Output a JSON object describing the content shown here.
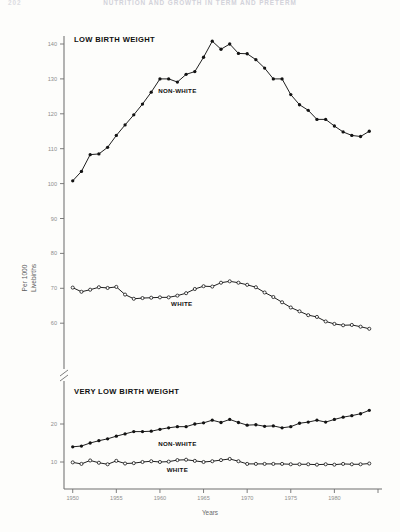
{
  "page": {
    "running_head": "NUTRITION AND GROWTH IN TERM AND PRETERM",
    "folio": "202"
  },
  "chart_data": {
    "type": "line",
    "title": "",
    "xlabel": "Years",
    "ylabel": "Per 1000\nLivebirths",
    "ylabel_line1": "Per 1000",
    "ylabel_line2": "Livebirths",
    "x_ticks": [
      1950,
      1955,
      1960,
      1965,
      1970,
      1975,
      1980
    ],
    "x_tick_labels": [
      "1950",
      "1955",
      "1960",
      "1965",
      "1970",
      "1975",
      "1980"
    ],
    "xlim": [
      1949,
      1985
    ],
    "grid": false,
    "legend_position": "inline-annotations",
    "axis_break": {
      "between": [
        60,
        20
      ],
      "symbol": "//"
    },
    "upper_panel": {
      "title": "LOW BIRTH WEIGHT",
      "y_ticks": [
        140,
        130,
        120,
        110,
        100,
        90,
        80,
        70,
        60
      ],
      "y_tick_labels": [
        "140",
        "130",
        "120",
        "110",
        "100",
        "90",
        "80",
        "70",
        "60"
      ],
      "ylim": [
        58,
        144
      ]
    },
    "lower_panel": {
      "title": "VERY LOW BIRTH WEIGHT",
      "y_ticks": [
        20,
        10
      ],
      "y_tick_labels": [
        "20",
        "10"
      ],
      "ylim": [
        5,
        27
      ]
    },
    "series": [
      {
        "name": "NON-WHITE",
        "panel": "upper",
        "marker": "filled",
        "label": "NON-WHITE",
        "label_x": 1962.0,
        "label_y": 126.0,
        "x": [
          1950,
          1951,
          1952,
          1953,
          1954,
          1955,
          1956,
          1957,
          1958,
          1959,
          1960,
          1961,
          1962,
          1963,
          1964,
          1965,
          1966,
          1967,
          1968,
          1969,
          1970,
          1971,
          1972,
          1973,
          1974,
          1975,
          1976,
          1977,
          1978,
          1979,
          1980,
          1981,
          1982,
          1983,
          1984
        ],
        "values": [
          100.8,
          103.5,
          108.3,
          108.5,
          110.4,
          113.8,
          116.8,
          119.7,
          122.8,
          126.2,
          130.0,
          130.0,
          129.1,
          131.3,
          132.1,
          136.2,
          140.8,
          138.5,
          140.0,
          137.3,
          137.2,
          135.5,
          133.1,
          130.0,
          130.0,
          125.5,
          122.6,
          121.0,
          118.4,
          118.4,
          116.5,
          114.8,
          113.8,
          113.5,
          115.0
        ]
      },
      {
        "name": "WHITE",
        "panel": "upper",
        "marker": "open",
        "label": "WHITE",
        "label_x": 1962.5,
        "label_y": 65.0,
        "x": [
          1950,
          1951,
          1952,
          1953,
          1954,
          1955,
          1956,
          1957,
          1958,
          1959,
          1960,
          1961,
          1962,
          1963,
          1964,
          1965,
          1966,
          1967,
          1968,
          1969,
          1970,
          1971,
          1972,
          1973,
          1974,
          1975,
          1976,
          1977,
          1978,
          1979,
          1980,
          1981,
          1982,
          1983,
          1984
        ],
        "values": [
          70.2,
          69.0,
          69.6,
          70.3,
          70.1,
          70.4,
          68.2,
          67.0,
          67.2,
          67.3,
          67.4,
          67.4,
          67.9,
          68.6,
          69.8,
          70.6,
          70.5,
          71.6,
          72.0,
          71.6,
          71.0,
          70.3,
          68.8,
          67.5,
          66.0,
          64.5,
          63.4,
          62.3,
          61.8,
          60.5,
          59.8,
          59.4,
          59.5,
          59.0,
          58.4
        ]
      },
      {
        "name": "NON-WHITE",
        "panel": "lower",
        "marker": "filled",
        "label": "NON-WHITE",
        "label_x": 1962.0,
        "label_y": 14.3,
        "x": [
          1950,
          1951,
          1952,
          1953,
          1954,
          1955,
          1956,
          1957,
          1958,
          1959,
          1960,
          1961,
          1962,
          1963,
          1964,
          1965,
          1966,
          1967,
          1968,
          1969,
          1970,
          1971,
          1972,
          1973,
          1974,
          1975,
          1976,
          1977,
          1978,
          1979,
          1980,
          1981,
          1982,
          1983,
          1984
        ],
        "values": [
          14.0,
          14.2,
          15.0,
          15.6,
          16.1,
          16.8,
          17.4,
          18.0,
          18.0,
          18.1,
          18.6,
          19.0,
          19.3,
          19.3,
          20.0,
          20.3,
          21.0,
          20.4,
          21.2,
          20.4,
          19.7,
          19.8,
          19.4,
          19.5,
          19.0,
          19.3,
          20.2,
          20.5,
          21.0,
          20.5,
          21.2,
          21.8,
          22.2,
          22.7,
          23.6
        ]
      },
      {
        "name": "WHITE",
        "panel": "lower",
        "marker": "open",
        "label": "WHITE",
        "label_x": 1962.0,
        "label_y": 7.4,
        "x": [
          1950,
          1951,
          1952,
          1953,
          1954,
          1955,
          1956,
          1957,
          1958,
          1959,
          1960,
          1961,
          1962,
          1963,
          1964,
          1965,
          1966,
          1967,
          1968,
          1969,
          1970,
          1971,
          1972,
          1973,
          1974,
          1975,
          1976,
          1977,
          1978,
          1979,
          1980,
          1981,
          1982,
          1983,
          1984
        ],
        "values": [
          9.9,
          9.5,
          10.4,
          9.8,
          9.4,
          10.3,
          9.6,
          9.7,
          10.0,
          10.2,
          10.0,
          10.1,
          10.5,
          10.6,
          10.3,
          10.0,
          10.2,
          10.5,
          10.8,
          10.2,
          9.5,
          9.5,
          9.5,
          9.5,
          9.5,
          9.4,
          9.4,
          9.4,
          9.3,
          9.4,
          9.3,
          9.5,
          9.4,
          9.4,
          9.6
        ]
      }
    ]
  }
}
